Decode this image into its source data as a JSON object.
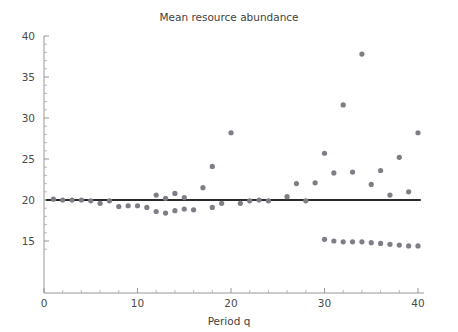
{
  "chart_data": {
    "type": "scatter",
    "title": "Mean resource abundance",
    "xlabel": "Period q",
    "ylabel": "",
    "xlim": [
      0,
      40
    ],
    "ylim": [
      13.2,
      40
    ],
    "grid": false,
    "legend": null,
    "x_ticks_major": [
      0,
      10,
      20,
      30,
      40
    ],
    "x_tick_labels": [
      "0",
      "10",
      "20",
      "30",
      "40"
    ],
    "x_ticks_minor": [
      2,
      4,
      6,
      8,
      12,
      14,
      16,
      18,
      22,
      24,
      26,
      28,
      32,
      34,
      36,
      38
    ],
    "y_ticks_major": [
      15,
      20,
      25,
      30,
      35,
      40
    ],
    "y_tick_labels": [
      "15",
      "20",
      "25",
      "30",
      "35",
      "40"
    ],
    "y_ticks_minor": [
      14,
      16,
      17,
      18,
      19,
      21,
      22,
      23,
      24,
      26,
      27,
      28,
      29,
      31,
      32,
      33,
      34,
      36,
      37,
      38,
      39
    ],
    "reference_line": {
      "label": "mean level",
      "y": 20.0,
      "x_start": 0.2,
      "x_end": 40.3,
      "color": "#2b2b2b"
    },
    "point_color": "#7e7e86",
    "point_radius": 2.6,
    "series": [
      {
        "name": "Mean resource abundance",
        "x": [
          1,
          2,
          3,
          4,
          5,
          6,
          7,
          8,
          9,
          10,
          11,
          12,
          12,
          13,
          13,
          14,
          14,
          15,
          15,
          16,
          17,
          18,
          18,
          19,
          20,
          21,
          22,
          23,
          24,
          26,
          27,
          28,
          29,
          30,
          30,
          31,
          31,
          32,
          32,
          33,
          33,
          34,
          34,
          35,
          35,
          36,
          36,
          37,
          37,
          38,
          38,
          39,
          39,
          40,
          40
        ],
        "y": [
          20.1,
          20.0,
          20.0,
          20.0,
          19.9,
          19.6,
          19.9,
          19.2,
          19.3,
          19.3,
          19.1,
          20.6,
          18.6,
          20.2,
          18.4,
          20.8,
          18.7,
          20.3,
          18.9,
          18.8,
          21.5,
          24.1,
          19.1,
          19.6,
          28.2,
          19.6,
          19.9,
          20.0,
          19.9,
          20.4,
          22.0,
          19.9,
          22.1,
          25.7,
          15.2,
          23.3,
          15.0,
          31.6,
          14.9,
          23.4,
          14.9,
          37.8,
          14.9,
          21.9,
          14.8,
          23.6,
          14.7,
          20.6,
          14.6,
          25.2,
          14.5,
          21.0,
          14.4,
          28.2,
          14.4
        ]
      }
    ]
  }
}
